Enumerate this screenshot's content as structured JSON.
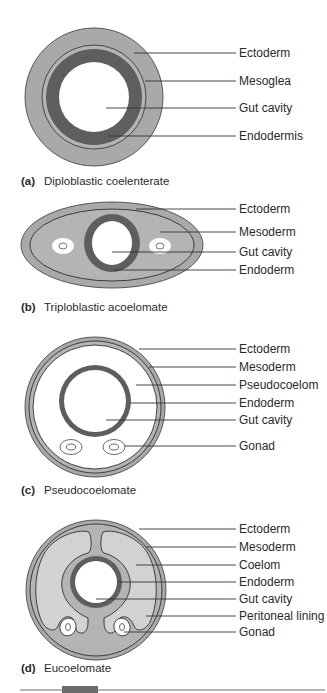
{
  "colors": {
    "ectoderm_grey": "#a9a9a9",
    "mesoderm_grey": "#b4b4b4",
    "coelom_light": "#d2d2d2",
    "endoderm_dark": "#5e5e5e",
    "outline": "#2f2f2f",
    "text": "#2a2a2a"
  },
  "panels": [
    {
      "id": "a",
      "caption_letter": "(a)",
      "caption_text": "Diploblastic coelenterate",
      "labels": [
        "Ectoderm",
        "Mesoglea",
        "Gut cavity",
        "Endodermis"
      ]
    },
    {
      "id": "b",
      "caption_letter": "(b)",
      "caption_text": "Triploblastic acoelomate",
      "labels": [
        "Ectoderm",
        "Mesoderm",
        "Gut cavity",
        "Endoderm"
      ]
    },
    {
      "id": "c",
      "caption_letter": "(c)",
      "caption_text": "Pseudocoelomate",
      "labels": [
        "Ectoderm",
        "Mesoderm",
        "Pseudocoelom",
        "Endoderm",
        "Gut cavity",
        "Gonad"
      ]
    },
    {
      "id": "d",
      "caption_letter": "(d)",
      "caption_text": "Eucoelomate",
      "labels": [
        "Ectoderm",
        "Mesoderm",
        "Coelom",
        "Endoderm",
        "Gut cavity",
        "Peritoneal lining",
        "Gonad"
      ]
    }
  ]
}
